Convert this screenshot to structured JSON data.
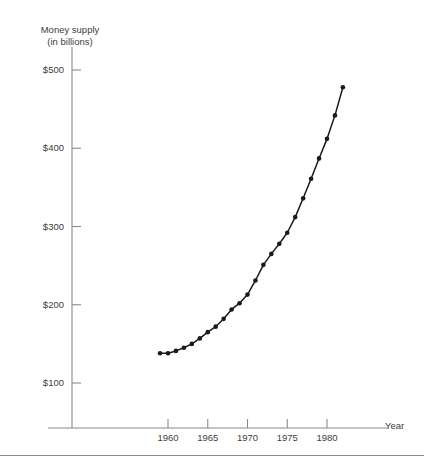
{
  "chart_data": {
    "type": "line",
    "title": "",
    "ylabel": "Money supply\n(in billions)",
    "ylabel_line1": "Money supply",
    "ylabel_line2": "(in billions)",
    "xlabel": "Year",
    "xlim": [
      1957,
      1984
    ],
    "ylim": [
      70,
      520
    ],
    "grid": false,
    "legend": null,
    "y_ticks": [
      {
        "value": 500,
        "label": "$500"
      },
      {
        "value": 400,
        "label": "$400"
      },
      {
        "value": 300,
        "label": "$300"
      },
      {
        "value": 200,
        "label": "$200"
      },
      {
        "value": 100,
        "label": "$100"
      }
    ],
    "x_ticks": [
      {
        "value": 1960,
        "label": "1960"
      },
      {
        "value": 1965,
        "label": "1965"
      },
      {
        "value": 1970,
        "label": "1970"
      },
      {
        "value": 1975,
        "label": "1975"
      },
      {
        "value": 1980,
        "label": "1980"
      }
    ],
    "marker": "filled-circle",
    "line_color": "#1a1a1a",
    "series": [
      {
        "name": "Money supply",
        "x": [
          1959,
          1960,
          1961,
          1962,
          1963,
          1964,
          1965,
          1966,
          1967,
          1968,
          1969,
          1970,
          1971,
          1972,
          1973,
          1974,
          1975,
          1976,
          1977,
          1978,
          1979,
          1980,
          1981,
          1982
        ],
        "values": [
          138,
          138,
          141,
          145,
          150,
          157,
          165,
          172,
          182,
          194,
          202,
          213,
          231,
          251,
          265,
          278,
          292,
          312,
          336,
          361,
          387,
          412,
          442,
          478
        ]
      }
    ]
  }
}
